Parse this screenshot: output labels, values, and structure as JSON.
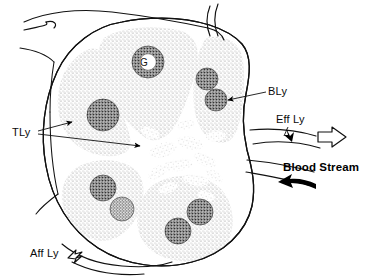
{
  "figure": {
    "background_color": "#ffffff",
    "ink_color": "#000000",
    "stipple_color": "#9a9a9a",
    "follicle_color": "#3a3a3a"
  },
  "labels": {
    "t_lymphocyte": "TLy",
    "b_lymphocyte": "BLy",
    "germinal_center": "G",
    "efferent_lymphatic": "Eff Ly",
    "afferent_lymphatic": "Aff Ly",
    "blood_stream": "Blood Stream"
  },
  "annotations": [
    {
      "name": "tly-label",
      "text": "TLy",
      "x": 12,
      "y": 136,
      "style": "plain",
      "arrows": 2,
      "arrow_style": "solid-filled"
    },
    {
      "name": "bly-label",
      "text": "BLy",
      "x": 268,
      "y": 95,
      "style": "plain",
      "arrows": 1,
      "arrow_style": "solid-filled"
    },
    {
      "name": "g-label",
      "text": "G",
      "x": 144,
      "y": 65,
      "style": "inset",
      "arrows": 0,
      "arrow_style": "none"
    },
    {
      "name": "eff-ly-label",
      "text": "Eff Ly",
      "x": 276,
      "y": 123,
      "style": "plain",
      "arrows": 1,
      "arrow_style": "solid-filled"
    },
    {
      "name": "aff-ly-label",
      "text": "Aff Ly",
      "x": 36,
      "y": 257,
      "style": "plain",
      "arrows": 1,
      "arrow_style": "hollow-outline"
    },
    {
      "name": "blood-stream-label",
      "text": "Blood Stream",
      "x": 283,
      "y": 171,
      "style": "bold",
      "arrows": 1,
      "arrow_style": "solid-filled"
    }
  ],
  "structures": {
    "capsule": "outer-node-outline",
    "cortical_lobules": 5,
    "follicles_total": 8,
    "medullary_cords": 12,
    "hilum_side": "right"
  }
}
